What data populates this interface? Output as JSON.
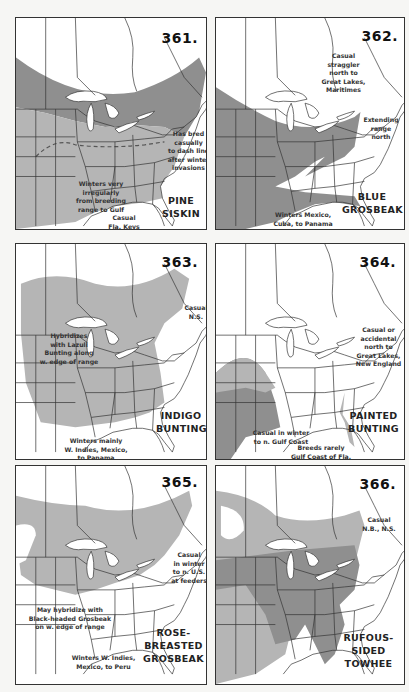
{
  "page": {
    "colors": {
      "paper": "#f6f6f4",
      "map_bg": "#ffffff",
      "range_light": "#b5b5b5",
      "range_dark": "#8f8f8f",
      "line": "#333333"
    }
  },
  "maps": [
    {
      "number": "361.",
      "species": [
        "PINE",
        "SISKIN"
      ],
      "notes": [
        "Has bred\ncasually\nto dash line\nafter winter\ninvasions",
        "Winters very\nirregularly\nfrom breeding\nrange to Gulf",
        "Casual\nFla. Keys"
      ]
    },
    {
      "number": "362.",
      "species": [
        "BLUE",
        "GROSBEAK"
      ],
      "notes": [
        "Casual\nstraggler\nnorth to\nGreat Lakes,\nMaritimes",
        "Extending\nrange\nnorth",
        "Winters Mexico,\nCuba, to Panama"
      ]
    },
    {
      "number": "363.",
      "species": [
        "INDIGO",
        "BUNTING"
      ],
      "notes": [
        "Casual\nN.S.",
        "Hybridizes\nwith Lazuli\nBunting along\nw. edge of range",
        "Winters mainly\nW. Indies, Mexico,\nto Panama"
      ]
    },
    {
      "number": "364.",
      "species": [
        "PAINTED",
        "BUNTING"
      ],
      "notes": [
        "Casual or\naccidental\nnorth to\nGreat Lakes,\nNew England",
        "Casual in winter\nto n. Gulf Coast",
        "Breeds rarely\nGulf Coast of Fla."
      ]
    },
    {
      "number": "365.",
      "species": [
        "ROSE-BREASTED",
        "GROSBEAK"
      ],
      "notes": [
        "Casual\nin winter\nto n. U.S.\nat feeders",
        "May hybridize with\nBlack-headed Grosbeak\non w. edge of range",
        "Winters W. Indies,\nMexico, to Peru"
      ]
    },
    {
      "number": "366.",
      "species": [
        "RUFOUS-SIDED",
        "TOWHEE"
      ],
      "notes": [
        "Casual\nN.B., N.S."
      ]
    }
  ]
}
